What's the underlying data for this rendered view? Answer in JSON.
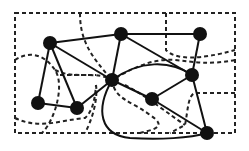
{
  "diagram": {
    "type": "graph-with-regions",
    "nodes": [
      {
        "id": "A",
        "x": 50,
        "y": 43
      },
      {
        "id": "B",
        "x": 121,
        "y": 34
      },
      {
        "id": "C",
        "x": 200,
        "y": 34
      },
      {
        "id": "D",
        "x": 112,
        "y": 80
      },
      {
        "id": "E",
        "x": 192,
        "y": 75
      },
      {
        "id": "F",
        "x": 38,
        "y": 103
      },
      {
        "id": "G",
        "x": 77,
        "y": 108
      },
      {
        "id": "H",
        "x": 152,
        "y": 99
      },
      {
        "id": "I",
        "x": 207,
        "y": 133
      }
    ],
    "edges": [
      [
        "A",
        "B"
      ],
      [
        "A",
        "D"
      ],
      [
        "A",
        "F"
      ],
      [
        "A",
        "G"
      ],
      [
        "B",
        "C"
      ],
      [
        "B",
        "D"
      ],
      [
        "B",
        "E"
      ],
      [
        "C",
        "E"
      ],
      [
        "D",
        "G"
      ],
      [
        "D",
        "E"
      ],
      [
        "D",
        "H"
      ],
      [
        "D",
        "I"
      ],
      [
        "F",
        "G"
      ],
      [
        "H",
        "E"
      ],
      [
        "H",
        "I"
      ],
      [
        "E",
        "I"
      ]
    ],
    "colors": {
      "node": "#111111",
      "edge": "#111111",
      "region": "#222222",
      "background": "#ffffff"
    }
  }
}
